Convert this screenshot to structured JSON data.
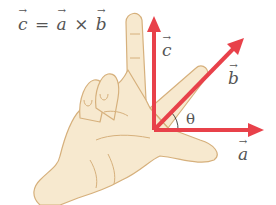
{
  "formula": {
    "c": "c",
    "eq": "=",
    "a": "a",
    "times": "×",
    "b": "b"
  },
  "labels": {
    "c": "c",
    "b": "b",
    "a": "a",
    "theta": "θ"
  },
  "colors": {
    "arrow": "#e8414a",
    "skin": "#f7e9cf",
    "skin_outline": "#d6b07c",
    "text": "#555555"
  }
}
